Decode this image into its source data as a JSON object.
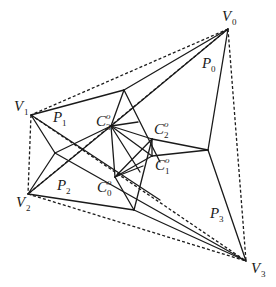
{
  "diagram": {
    "title": "",
    "vertices": [
      {
        "id": "V0",
        "base": "V",
        "sub": "0",
        "sup": "",
        "x": 228,
        "y": 29,
        "lx": 222,
        "ly": 21
      },
      {
        "id": "V1",
        "base": "V",
        "sub": "1",
        "sup": "",
        "x": 31,
        "y": 115,
        "lx": 14,
        "ly": 111
      },
      {
        "id": "V2",
        "base": "V",
        "sub": "2",
        "sup": "",
        "x": 28,
        "y": 194,
        "lx": 16,
        "ly": 207
      },
      {
        "id": "V3",
        "base": "V",
        "sub": "3",
        "sup": "",
        "x": 246,
        "y": 261,
        "lx": 251,
        "ly": 273
      }
    ],
    "regions": [
      {
        "id": "P0",
        "base": "P",
        "sub": "0",
        "sup": "",
        "lx": 202,
        "ly": 68
      },
      {
        "id": "P1",
        "base": "P",
        "sub": "1",
        "sup": "",
        "lx": 53,
        "ly": 122
      },
      {
        "id": "P2",
        "base": "P",
        "sub": "2",
        "sup": "",
        "lx": 57,
        "ly": 190
      },
      {
        "id": "P3",
        "base": "P",
        "sub": "3",
        "sup": "",
        "lx": 210,
        "ly": 218
      }
    ],
    "centers": [
      {
        "id": "C0",
        "base": "C",
        "sub": "0",
        "sup": "o",
        "x": 115,
        "y": 177,
        "lx": 97,
        "ly": 192
      },
      {
        "id": "C1",
        "base": "C",
        "sub": "1",
        "sup": "o",
        "x": 152,
        "y": 156,
        "lx": 155,
        "ly": 170
      },
      {
        "id": "C2",
        "base": "C",
        "sub": "2",
        "sup": "o",
        "x": 152,
        "y": 139,
        "lx": 154,
        "ly": 134
      },
      {
        "id": "C3",
        "base": "C",
        "sub": "3",
        "sup": "o",
        "x": 111,
        "y": 126,
        "lx": 96,
        "ly": 126
      }
    ],
    "nodes": [
      {
        "id": "N_top",
        "x": 124,
        "y": 90
      },
      {
        "id": "N_right",
        "x": 208,
        "y": 150
      },
      {
        "id": "N_bottom",
        "x": 134,
        "y": 210
      },
      {
        "id": "N_left",
        "x": 55,
        "y": 153
      }
    ],
    "solid_edges": [
      [
        "V0",
        "V1s"
      ],
      [
        "V0",
        "N_top"
      ],
      [
        "V0",
        "N_right"
      ],
      [
        "V1",
        "N_top"
      ],
      [
        "V1",
        "C0"
      ],
      [
        "V1",
        "N_left"
      ],
      [
        "V2",
        "N_left"
      ],
      [
        "V2",
        "C3"
      ],
      [
        "V2",
        "N_bottom"
      ],
      [
        "V3",
        "N_right"
      ],
      [
        "V3",
        "N_bottom"
      ],
      [
        "V3",
        "C3"
      ]
    ],
    "dashed_edges": [
      [
        "V0",
        "V1"
      ],
      [
        "V1",
        "V2"
      ],
      [
        "V2",
        "V3"
      ],
      [
        "V0",
        "V3"
      ],
      [
        "V0",
        "V2"
      ],
      [
        "V1",
        "V3"
      ]
    ]
  }
}
